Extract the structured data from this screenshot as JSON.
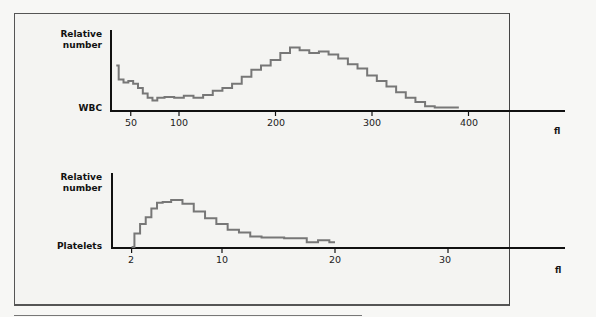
{
  "chart_data": [
    {
      "type": "line",
      "title": "WBC",
      "ylabel": "Relative number",
      "xlabel": "fl",
      "series_label": "WBC",
      "xticks": [
        50,
        100,
        200,
        300,
        400
      ],
      "xlim": [
        35,
        500
      ],
      "grid": false,
      "x": [
        35,
        40,
        45,
        50,
        55,
        60,
        65,
        70,
        75,
        80,
        90,
        100,
        110,
        120,
        130,
        140,
        150,
        160,
        170,
        180,
        190,
        200,
        210,
        220,
        230,
        240,
        250,
        260,
        270,
        280,
        290,
        300,
        310,
        320,
        330,
        340,
        350,
        360,
        370,
        380,
        390
      ],
      "y": [
        0.62,
        0.42,
        0.38,
        0.4,
        0.36,
        0.3,
        0.22,
        0.16,
        0.12,
        0.16,
        0.17,
        0.16,
        0.19,
        0.16,
        0.2,
        0.26,
        0.3,
        0.36,
        0.46,
        0.56,
        0.62,
        0.7,
        0.8,
        0.88,
        0.84,
        0.8,
        0.82,
        0.78,
        0.72,
        0.64,
        0.58,
        0.48,
        0.4,
        0.32,
        0.24,
        0.16,
        0.1,
        0.04,
        0.02,
        0.02,
        0.02
      ]
    },
    {
      "type": "line",
      "title": "Platelets",
      "ylabel": "Relative number",
      "xlabel": "fl",
      "series_label": "Platelets",
      "xticks": [
        2,
        10,
        20,
        30
      ],
      "xlim": [
        0,
        40
      ],
      "grid": false,
      "x": [
        2,
        2.5,
        3,
        3.5,
        4,
        4.5,
        5,
        6,
        7,
        8,
        9,
        10,
        11,
        12,
        13,
        14,
        15,
        16,
        17,
        18,
        19,
        20
      ],
      "y": [
        0.0,
        0.28,
        0.48,
        0.62,
        0.8,
        0.92,
        0.94,
        0.98,
        0.9,
        0.74,
        0.6,
        0.48,
        0.36,
        0.3,
        0.22,
        0.2,
        0.2,
        0.18,
        0.18,
        0.1,
        0.14,
        0.1
      ]
    }
  ],
  "wbc": {
    "ylabel_line1": "Relative",
    "ylabel_line2": "number",
    "series_label": "WBC",
    "unit": "fl",
    "ticks": [
      "50",
      "100",
      "200",
      "300",
      "400"
    ]
  },
  "platelets": {
    "ylabel_line1": "Relative",
    "ylabel_line2": "number",
    "series_label": "Platelets",
    "unit": "fl",
    "ticks": [
      "2",
      "10",
      "20",
      "30"
    ]
  },
  "colors": {
    "axis": "#111111",
    "curve": "#777777",
    "background": "#f4f4f2"
  }
}
